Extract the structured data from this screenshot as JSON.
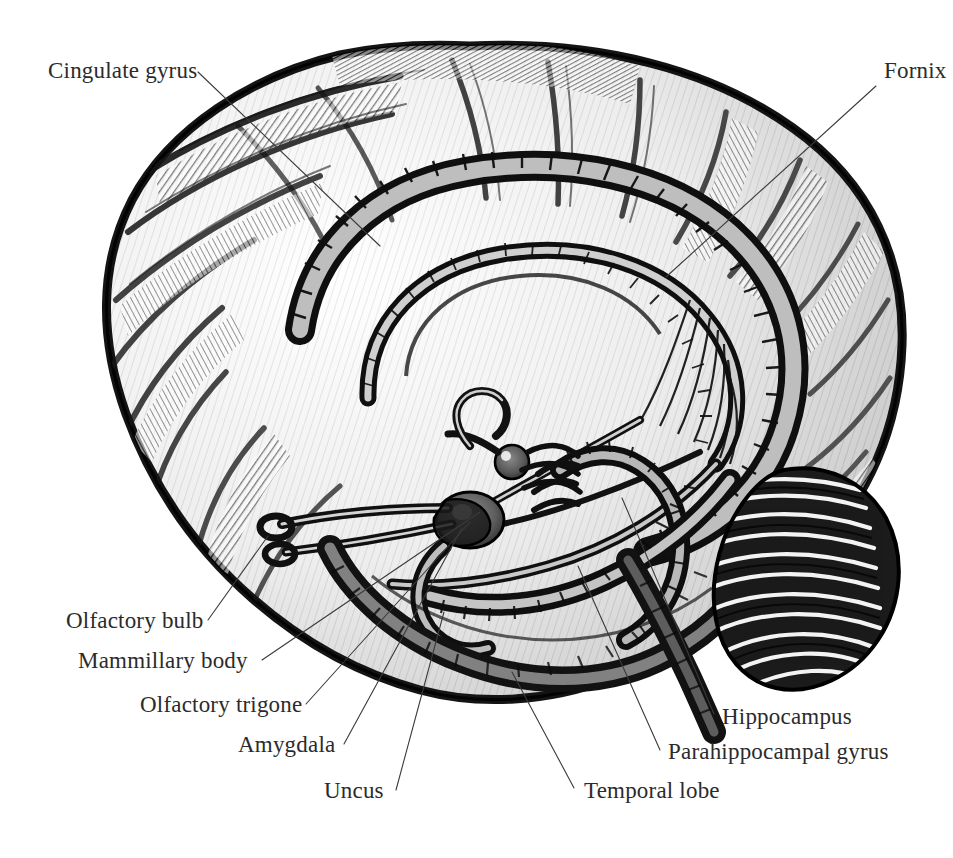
{
  "figure": {
    "style": "pen-and-ink engraving",
    "background_color": "#ffffff",
    "ink_color": "#1a1a1a",
    "label_color": "#2b2b2b",
    "leader_color": "#3a3a3a",
    "width": 953,
    "height": 858
  },
  "labels": [
    {
      "id": "cingulate-gyrus",
      "text": "Cingulate gyrus",
      "anchor": "start",
      "x": 48,
      "y": 78,
      "leader": [
        [
          198,
          72
        ],
        [
          380,
          246
        ]
      ]
    },
    {
      "id": "fornix",
      "text": "Fornix",
      "anchor": "start",
      "x": 884,
      "y": 78,
      "leader": [
        [
          876,
          86
        ],
        [
          666,
          277
        ]
      ]
    },
    {
      "id": "olfactory-bulb",
      "text": "Olfactory bulb",
      "anchor": "start",
      "x": 66,
      "y": 628,
      "leader": [
        [
          208,
          620
        ],
        [
          268,
          536
        ]
      ]
    },
    {
      "id": "mammillary-body",
      "text": "Mammillary body",
      "anchor": "start",
      "x": 78,
      "y": 668,
      "leader": [
        [
          262,
          660
        ],
        [
          480,
          512
        ]
      ]
    },
    {
      "id": "olfactory-trigone",
      "text": "Olfactory trigone",
      "anchor": "start",
      "x": 140,
      "y": 712,
      "leader": [
        [
          306,
          704
        ],
        [
          470,
          522
        ]
      ]
    },
    {
      "id": "amygdala",
      "text": "Amygdala",
      "anchor": "start",
      "x": 238,
      "y": 752,
      "leader": [
        [
          344,
          744
        ],
        [
          462,
          528
        ]
      ]
    },
    {
      "id": "uncus",
      "text": "Uncus",
      "anchor": "start",
      "x": 324,
      "y": 798,
      "leader": [
        [
          396,
          790
        ],
        [
          444,
          612
        ]
      ]
    },
    {
      "id": "temporal-lobe",
      "text": "Temporal lobe",
      "anchor": "start",
      "x": 584,
      "y": 798,
      "leader": [
        [
          574,
          788
        ],
        [
          512,
          672
        ]
      ]
    },
    {
      "id": "parahippocampal-gyrus",
      "text": "Parahippocampal gyrus",
      "anchor": "start",
      "x": 668,
      "y": 759,
      "leader": [
        [
          660,
          750
        ],
        [
          578,
          566
        ]
      ]
    },
    {
      "id": "hippocampus",
      "text": "Hippocampus",
      "anchor": "start",
      "x": 722,
      "y": 724,
      "leader": [
        [
          714,
          714
        ],
        [
          622,
          498
        ]
      ]
    }
  ]
}
